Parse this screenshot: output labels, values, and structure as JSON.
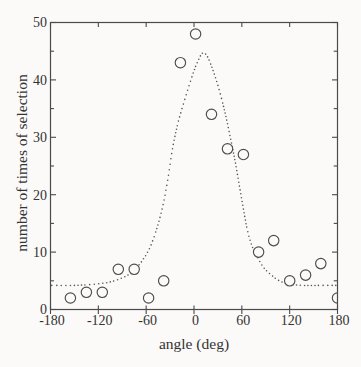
{
  "chart_data": {
    "type": "scatter",
    "title": "",
    "xlabel": "angle (deg)",
    "ylabel": "number of times of selection",
    "xlim": [
      -180,
      180
    ],
    "ylim": [
      0,
      50
    ],
    "x_ticks": [
      -180,
      -120,
      -60,
      0,
      60,
      120,
      180
    ],
    "x_tick_labels": [
      "-180",
      "-120",
      "-60",
      "0",
      "60",
      "120",
      "180"
    ],
    "y_ticks": [
      0,
      10,
      20,
      30,
      40,
      50
    ],
    "y_tick_labels": [
      "0",
      "10",
      "20",
      "30",
      "40",
      "50"
    ],
    "y_minor_tick_step": 5,
    "grid": "off",
    "legend": "none",
    "marker": "open-circle",
    "points": [
      [
        -155,
        2
      ],
      [
        -135,
        3
      ],
      [
        -115,
        3
      ],
      [
        -95,
        7
      ],
      [
        -75,
        7
      ],
      [
        -57,
        2
      ],
      [
        -38,
        5
      ],
      [
        -17,
        43
      ],
      [
        2,
        48
      ],
      [
        22,
        34
      ],
      [
        42,
        28
      ],
      [
        62,
        27
      ],
      [
        81,
        10
      ],
      [
        100,
        12
      ],
      [
        120,
        5
      ],
      [
        140,
        6
      ],
      [
        159,
        8
      ],
      [
        180,
        2
      ]
    ],
    "fit_curve": {
      "style": "dotted",
      "shape": "bell-curve-on-baseline",
      "baseline": 4.2,
      "peak": 44.7,
      "peak_angle": 11,
      "anchors": [
        [
          -180,
          4.2
        ],
        [
          -150,
          4.2
        ],
        [
          -125,
          4.4
        ],
        [
          -105,
          4.8
        ],
        [
          -90,
          5.5
        ],
        [
          -78,
          6.5
        ],
        [
          -66,
          8.3
        ],
        [
          -56,
          10.6
        ],
        [
          -48,
          13.5
        ],
        [
          -40,
          17.5
        ],
        [
          -33,
          22.5
        ],
        [
          -27,
          28
        ],
        [
          -21,
          32
        ],
        [
          -15,
          35
        ],
        [
          -8,
          38.2
        ],
        [
          -1,
          41.2
        ],
        [
          5,
          43.3
        ],
        [
          11,
          44.7
        ],
        [
          17,
          44
        ],
        [
          23,
          42
        ],
        [
          29,
          39.5
        ],
        [
          35,
          36.5
        ],
        [
          41,
          33
        ],
        [
          47,
          29
        ],
        [
          52,
          25.5
        ],
        [
          57,
          21.5
        ],
        [
          62,
          17.5
        ],
        [
          67,
          13.8
        ],
        [
          73,
          11
        ],
        [
          80,
          9
        ],
        [
          88,
          7.2
        ],
        [
          97,
          6
        ],
        [
          107,
          5
        ],
        [
          118,
          4.5
        ],
        [
          135,
          4.2
        ],
        [
          160,
          4.2
        ],
        [
          180,
          4.2
        ]
      ]
    }
  },
  "colors": {
    "background": "#fbfaf8",
    "axis": "#4a4a4a",
    "text": "#333333",
    "curve_dots": "#575757",
    "marker_stroke": "#4d4d4d",
    "marker_fill": "#fbfaf8"
  }
}
